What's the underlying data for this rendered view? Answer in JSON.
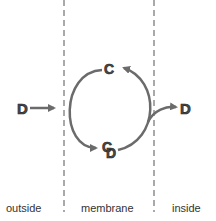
{
  "diagram": {
    "nodes": {
      "d_outside": "D",
      "c_top": "C",
      "c_bottom": "C",
      "d_bound": "D",
      "d_inside": "D"
    },
    "regions": {
      "outside": "outside",
      "membrane": "membrane",
      "inside": "inside"
    },
    "colors": {
      "arrow": "#6b6b6b",
      "text": "#333333",
      "dashed_line": "#555555"
    }
  }
}
